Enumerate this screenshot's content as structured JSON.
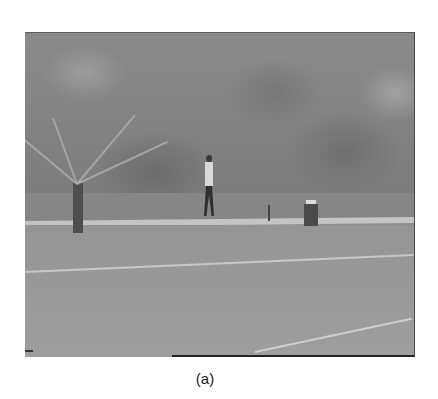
{
  "figure": {
    "caption": "(a)"
  }
}
